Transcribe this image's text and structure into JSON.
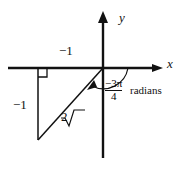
{
  "figure": {
    "background": "#ffffff",
    "ink_color": "#111111",
    "axes": {
      "x_axis_label": "x",
      "y_axis_label": "y",
      "origin": [
        103,
        68
      ],
      "x_axis_from": [
        8,
        68
      ],
      "x_axis_to": [
        163,
        68
      ],
      "y_axis_from": [
        103,
        13
      ],
      "y_axis_to": [
        103,
        158
      ],
      "x_arrow": "right",
      "y_arrow": "up"
    },
    "triangle": {
      "vertices": [
        [
          103,
          68
        ],
        [
          38,
          68
        ],
        [
          38,
          140
        ]
      ],
      "right_angle_marker_at": [
        38,
        68
      ],
      "horizontal_leg_label": "−1",
      "vertical_leg_label": "−1",
      "hypotenuse_label_radical": "√",
      "hypotenuse_label_value": "2"
    },
    "angle": {
      "arc_from_axis": "positive x-axis",
      "sweep": "clockwise",
      "arrowhead_on": "terminal ray",
      "numerator": "−3π",
      "denominator": "4",
      "unit_label": "radians"
    }
  }
}
